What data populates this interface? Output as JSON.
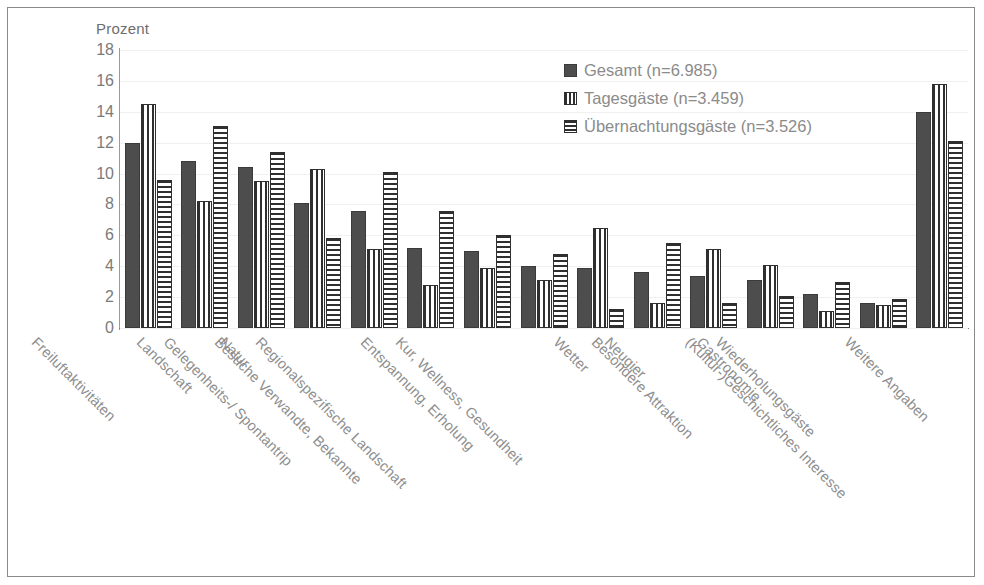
{
  "chart_data": {
    "type": "bar",
    "title": "",
    "ylabel": "Prozent",
    "xlabel": "",
    "ylim": [
      0,
      18
    ],
    "ytick_step": 2,
    "yticks": [
      "18",
      "16",
      "14",
      "12",
      "10",
      "8",
      "6",
      "4",
      "2",
      "0"
    ],
    "grid": true,
    "legend_position": "top-right",
    "categories": [
      "Freiluftaktivitäten",
      "Landschaft",
      "Natur",
      "Gelegenheits-/ Spontantrip",
      "Besuche Verwandte, Bekannte",
      "Regionalspezifische Landschaft",
      "Entspannung, Erholung",
      "Kur, Wellness, Gesundheit",
      "Wetter",
      "Neugier",
      "Besondere Attraktion",
      "Gastronomie",
      "Wiederholungsgäste",
      "(Kultur-)Geschichtliches Interesse",
      "Weitere Angaben"
    ],
    "series": [
      {
        "name": "Gesamt (n=6.985)",
        "pattern": "solid",
        "color": "#4d4d4d",
        "values": [
          12.0,
          10.8,
          10.4,
          8.1,
          7.6,
          5.2,
          5.0,
          4.0,
          3.9,
          3.6,
          3.4,
          3.1,
          2.2,
          1.6,
          14.0
        ]
      },
      {
        "name": "Tagesgäste (n=3.459)",
        "pattern": "vertical-stripes",
        "color": "#2f2f2f",
        "values": [
          14.5,
          8.2,
          9.5,
          10.3,
          5.1,
          2.8,
          3.9,
          3.1,
          6.5,
          1.6,
          5.1,
          4.1,
          1.1,
          1.5,
          15.8
        ]
      },
      {
        "name": "Übernachtungsgäste (n=3.526)",
        "pattern": "horizontal-stripes",
        "color": "#2f2f2f",
        "values": [
          9.6,
          13.1,
          11.4,
          5.8,
          10.1,
          7.6,
          6.0,
          4.8,
          1.2,
          5.5,
          1.6,
          2.1,
          3.0,
          1.9,
          12.1
        ]
      }
    ]
  }
}
